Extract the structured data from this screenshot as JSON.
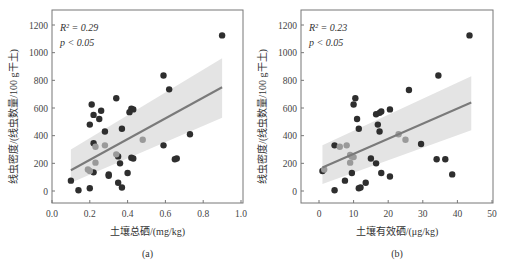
{
  "chart_data": [
    {
      "type": "scatter",
      "panel_label": "(a)",
      "xlabel": "土壤总硒/(mg/kg)",
      "ylabel": "线虫密度/(线虫数量/100 g干土)",
      "xlim": [
        0.0,
        1.0
      ],
      "ylim": [
        -100,
        1300
      ],
      "xticks": [
        "0.0",
        "0.2",
        "0.4",
        "0.6",
        "0.8",
        "1.0"
      ],
      "yticks": [
        "0",
        "200",
        "400",
        "600",
        "800",
        "1000",
        "1200"
      ],
      "annotations": {
        "r2": "R² = 0.29",
        "p": "p < 0.05"
      },
      "regression": {
        "x": [
          0.1,
          0.9
        ],
        "y": [
          150,
          750
        ]
      },
      "ci_band": {
        "x": [
          0.1,
          0.9
        ],
        "upper": [
          300,
          960
        ],
        "lower": [
          60,
          530
        ]
      },
      "points": [
        [
          0.9,
          1125
        ],
        [
          0.59,
          835
        ],
        [
          0.62,
          735
        ],
        [
          0.34,
          670
        ],
        [
          0.21,
          625
        ],
        [
          0.26,
          580
        ],
        [
          0.42,
          595
        ],
        [
          0.43,
          590
        ],
        [
          0.41,
          570
        ],
        [
          0.22,
          550
        ],
        [
          0.25,
          520
        ],
        [
          0.2,
          480
        ],
        [
          0.37,
          450
        ],
        [
          0.28,
          430
        ],
        [
          0.73,
          410
        ],
        [
          0.22,
          345
        ],
        [
          0.59,
          330
        ],
        [
          0.35,
          250
        ],
        [
          0.36,
          200
        ],
        [
          0.42,
          240
        ],
        [
          0.43,
          235
        ],
        [
          0.66,
          235
        ],
        [
          0.65,
          230
        ],
        [
          0.22,
          135
        ],
        [
          0.3,
          120
        ],
        [
          0.3,
          110
        ],
        [
          0.4,
          130
        ],
        [
          0.1,
          75
        ],
        [
          0.35,
          60
        ],
        [
          0.37,
          25
        ],
        [
          0.14,
          5
        ],
        [
          0.2,
          20
        ]
      ],
      "highlight_points": [
        [
          0.48,
          370
        ],
        [
          0.28,
          330
        ],
        [
          0.23,
          320
        ],
        [
          0.34,
          265
        ],
        [
          0.23,
          205
        ],
        [
          0.19,
          155
        ],
        [
          0.2,
          145
        ]
      ]
    },
    {
      "type": "scatter",
      "panel_label": "(b)",
      "xlabel": "土壤有效硒/(μg/kg)",
      "ylabel": "线虫密度/(线虫数量/100 g干土)",
      "xlim": [
        -3,
        50
      ],
      "ylim": [
        -100,
        1300
      ],
      "xticks": [
        "0",
        "10",
        "20",
        "30",
        "40",
        "50"
      ],
      "yticks": [
        "0",
        "200",
        "400",
        "600",
        "800",
        "1000",
        "1200"
      ],
      "annotations": {
        "r2": "R² = 0.23",
        "p": "p < 0.05"
      },
      "regression": {
        "x": [
          1,
          44
        ],
        "y": [
          170,
          640
        ]
      },
      "ci_band": {
        "x": [
          1,
          44
        ],
        "upper": [
          330,
          830
        ],
        "lower": [
          50,
          440
        ]
      },
      "points": [
        [
          43.5,
          1125
        ],
        [
          34.5,
          835
        ],
        [
          26,
          730
        ],
        [
          10.5,
          670
        ],
        [
          10,
          625
        ],
        [
          11,
          520
        ],
        [
          11.5,
          450
        ],
        [
          16.5,
          555
        ],
        [
          17.5,
          565
        ],
        [
          18,
          575
        ],
        [
          20.5,
          590
        ],
        [
          17,
          480
        ],
        [
          17.5,
          430
        ],
        [
          4.5,
          330
        ],
        [
          29.5,
          340
        ],
        [
          15,
          235
        ],
        [
          16.5,
          200
        ],
        [
          34,
          230
        ],
        [
          36.5,
          230
        ],
        [
          38.5,
          120
        ],
        [
          9.5,
          130
        ],
        [
          18,
          130
        ],
        [
          20.5,
          105
        ],
        [
          7.5,
          75
        ],
        [
          13.5,
          60
        ],
        [
          11.5,
          20
        ],
        [
          12,
          25
        ],
        [
          4.5,
          5
        ],
        [
          1,
          145
        ]
      ],
      "highlight_points": [
        [
          23,
          410
        ],
        [
          25,
          370
        ],
        [
          6,
          320
        ],
        [
          8,
          330
        ],
        [
          9,
          260
        ],
        [
          9.5,
          250
        ],
        [
          10,
          245
        ],
        [
          9,
          205
        ],
        [
          1.5,
          155
        ]
      ]
    }
  ]
}
